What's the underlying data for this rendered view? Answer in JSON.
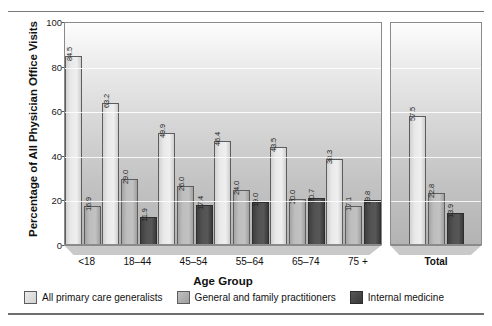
{
  "chart_data": {
    "type": "bar",
    "title": "",
    "xlabel": "Age Group",
    "ylabel": "Percentage of All Physician Office Visits",
    "ylim": [
      0,
      100
    ],
    "yticks": [
      0,
      20,
      40,
      60,
      80,
      100
    ],
    "grid": true,
    "legend_position": "bottom",
    "categories": [
      "<18",
      "18–44",
      "45–54",
      "55–64",
      "65–74",
      "75 +"
    ],
    "total_category": "Total",
    "series": [
      {
        "name": "All primary care generalists",
        "color": "#e3e3e3",
        "values": [
          84.5,
          63.2,
          49.9,
          46.4,
          43.5,
          38.3
        ],
        "total": 57.5
      },
      {
        "name": "General and family practitioners",
        "color": "#b4b4b4",
        "values": [
          16.9,
          29.0,
          26.0,
          24.0,
          20.0,
          17.1
        ],
        "total": 22.8
      },
      {
        "name": "Internal medicine",
        "color": "#4c4c4c",
        "values": [
          null,
          11.9,
          17.4,
          19.0,
          20.7,
          19.8
        ],
        "total": 13.9
      }
    ],
    "value_labels": {
      "g0": [
        "84.5",
        "16.9"
      ],
      "g1": [
        "63.2",
        "29.0",
        "11.9"
      ],
      "g2": [
        "49.9",
        "26.0",
        "17.4"
      ],
      "g3": [
        "46.4",
        "24.0",
        "19.0"
      ],
      "g4": [
        "43.5",
        "20.0",
        "20.7"
      ],
      "g5": [
        "38.3",
        "17.1",
        "19.8"
      ],
      "total": [
        "57.5",
        "22.8",
        "13.9"
      ]
    }
  },
  "axis": {
    "y_title": "Percentage of All Physician Office Visits",
    "x_title": "Age Group",
    "y_tick_labels": [
      "100",
      "80",
      "60",
      "40",
      "20",
      "0"
    ]
  },
  "legend": {
    "items": [
      {
        "label": "All primary care generalists"
      },
      {
        "label": "General and family practitioners"
      },
      {
        "label": "Internal medicine"
      }
    ]
  }
}
